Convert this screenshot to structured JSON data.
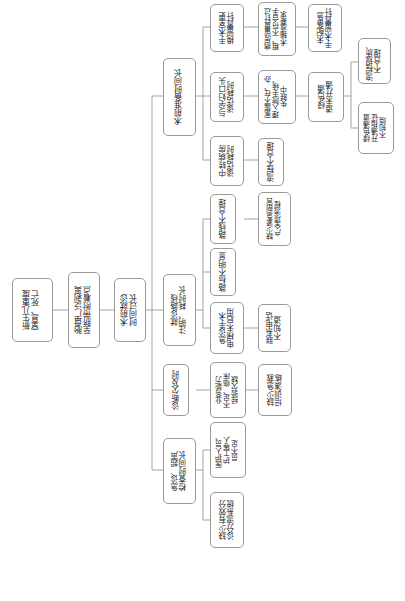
{
  "diagram": {
    "type": "root-cause-tree",
    "orientation": "rotated-90-ccw",
    "box_border_color": "#9a9a9a",
    "line_color": "#9a9a9a",
    "background_color": "#ffffff",
    "nodes": [
      {
        "id": "n1",
        "label": "新生儿重度\n窒息、死亡",
        "level": 0
      },
      {
        "id": "n2",
        "label": "胎盘广泛剥离\n至脐带附着点",
        "level": 1
      },
      {
        "id": "n3",
        "label": "术前就诊\n时间过长",
        "level": 2
      },
      {
        "id": "b1",
        "label": "术前准备时间长",
        "level": 3
      },
      {
        "id": "b1a",
        "label": "手术室更\n换留置针",
        "level": 4
      },
      {
        "id": "b1a1",
        "label": "病房留置针过\n粗、不符合手\n术输液要求",
        "level": 5
      },
      {
        "id": "b1a2",
        "label": "未配备急\n手术留置针",
        "level": 6
      },
      {
        "id": "b1b",
        "label": "与孕妇口头\n谈话耗时",
        "level": 4
      },
      {
        "id": "b1b1",
        "label": "家属不在、办\n理入院手续、\n失联中",
        "level": 5
      },
      {
        "id": "b1b2",
        "label": "绿色通\n道未开通",
        "level": 6
      },
      {
        "id": "b1b3",
        "label": "流程规质、\n不合理",
        "level": 7
      },
      {
        "id": "b1b4",
        "label": "绿色通道\n开通指征\n不知晓",
        "level": 7
      },
      {
        "id": "b1c",
        "label": "中转病房\n谈话耗时",
        "level": 4
      },
      {
        "id": "b1c1",
        "label": "流程不合理",
        "level": 5
      },
      {
        "id": "b2",
        "label": "就诊路线\n注明、耗时长",
        "level": 3
      },
      {
        "id": "b2a",
        "label": "路线不合理",
        "level": 4
      },
      {
        "id": "b2a1",
        "label": "缺少紧急剖宫\n产全项流程",
        "level": 5
      },
      {
        "id": "b2b",
        "label": "路标不明显",
        "level": 4
      },
      {
        "id": "b2c",
        "label": "急诊手术\n电梯未启用",
        "level": 4
      },
      {
        "id": "b2c1",
        "label": "联系电话\n不知道",
        "level": 5
      },
      {
        "id": "b3",
        "label": "诊断欠及时",
        "level": 3
      },
      {
        "id": "b3a",
        "label": "业务能力\n不足、临床\n经验欠缺",
        "level": 4
      },
      {
        "id": "b3a1",
        "label": "缺少急救\n培训演练",
        "level": 5
      },
      {
        "id": "b4",
        "label": "急诊、超声\n检查时间长",
        "level": 3
      },
      {
        "id": "b4a",
        "label": "医护人员、\n护工等人\n员不足",
        "level": 4
      },
      {
        "id": "b4b",
        "label": "缺少有效分\n诊分流系统",
        "level": 4
      }
    ]
  }
}
